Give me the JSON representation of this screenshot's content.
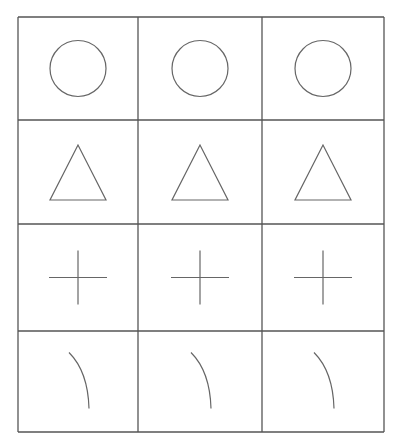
{
  "grid": {
    "rows": 4,
    "cols": 3,
    "line_color": "#555555",
    "shape_color": "#666666",
    "background": "#ffffff",
    "col_edges": [
      18,
      138,
      262,
      384
    ],
    "row_edges": [
      17,
      120,
      224,
      331,
      432
    ]
  },
  "rows": [
    {
      "shape": "circle",
      "cells": [
        "circle",
        "circle",
        "circle"
      ]
    },
    {
      "shape": "triangle",
      "cells": [
        "triangle",
        "triangle",
        "triangle"
      ]
    },
    {
      "shape": "cross",
      "cells": [
        "cross",
        "cross",
        "cross"
      ]
    },
    {
      "shape": "arc",
      "cells": [
        "arc",
        "arc",
        "arc"
      ]
    }
  ]
}
